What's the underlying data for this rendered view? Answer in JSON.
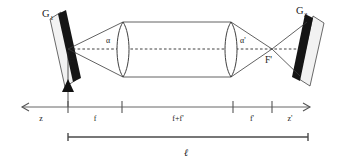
{
  "figure": {
    "kind": "optical-beam-expander-diagram"
  },
  "labels": {
    "grating_left": "G",
    "grating_left_sub": "1",
    "grating_right": "G",
    "grating_right_sub": "2",
    "focus_left": "F",
    "focus_right": "F'",
    "angle_left": "α",
    "angle_right": "α'"
  },
  "axis": {
    "segments": [
      {
        "name": "z",
        "label": "z"
      },
      {
        "name": "f",
        "label": "f"
      },
      {
        "name": "f-plus-fprime",
        "label": "f+f'"
      },
      {
        "name": "f-prime",
        "label": "f'"
      },
      {
        "name": "z-prime",
        "label": "z'"
      }
    ]
  },
  "total_length": {
    "label": "ℓ"
  },
  "colors": {
    "ink": "#262626",
    "mirror_dark": "#151515",
    "axis": "#555555",
    "background": "#ffffff"
  }
}
